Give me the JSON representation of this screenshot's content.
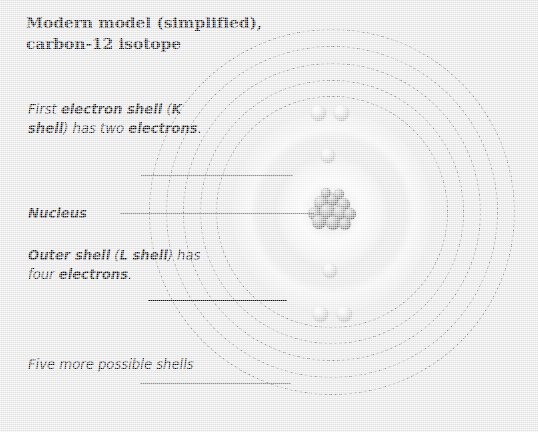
{
  "diagram": {
    "title_line1": "Modern model (simplified),",
    "title_line2": "carbon-12 isotope",
    "background_color": "#e9e9e9",
    "line_color": "#1a1a1a",
    "dashed_ring_color": "#8d8f91"
  },
  "callouts": {
    "k_shell": {
      "name": "first-electron-shell",
      "segments": [
        {
          "text": "First ",
          "bold": false
        },
        {
          "text": "electron shell",
          "bold": true
        },
        {
          "text": " (",
          "bold": false
        },
        {
          "text": "K shell",
          "bold": true
        },
        {
          "text": ") has two ",
          "bold": false
        },
        {
          "text": "electrons",
          "bold": true
        },
        {
          "text": ".",
          "bold": false
        }
      ]
    },
    "nucleus": {
      "name": "nucleus",
      "segments": [
        {
          "text": "Nucleus",
          "bold": true
        }
      ]
    },
    "l_shell": {
      "name": "outer-electron-shell",
      "segments": [
        {
          "text": "Outer shell",
          "bold": true
        },
        {
          "text": " (",
          "bold": false
        },
        {
          "text": "L shell",
          "bold": true
        },
        {
          "text": ") has four ",
          "bold": false
        },
        {
          "text": "electrons",
          "bold": true
        },
        {
          "text": ".",
          "bold": false
        }
      ]
    },
    "more_shells": {
      "name": "five-more-possible-shells",
      "segments": [
        {
          "text": "Five more possible shells",
          "bold": false
        }
      ]
    }
  },
  "atom": {
    "center_x": 332,
    "center_y": 212,
    "element": "carbon-12",
    "nucleon_count": 12,
    "proton_count": 6,
    "neutron_count": 6,
    "shells": [
      {
        "label": "K shell",
        "type": "solid",
        "radius": 58,
        "electrons": 2
      },
      {
        "label": "L shell",
        "type": "solid",
        "radius": 100,
        "electrons": 4
      },
      {
        "label": "possible shell 3",
        "type": "dashed",
        "radius": 116,
        "electrons": 0
      },
      {
        "label": "possible shell 4",
        "type": "dashed",
        "radius": 132,
        "electrons": 0
      },
      {
        "label": "possible shell 5",
        "type": "dashed",
        "radius": 149,
        "electrons": 0
      },
      {
        "label": "possible shell 6",
        "type": "dashed",
        "radius": 166,
        "electrons": 0
      },
      {
        "label": "possible shell 7",
        "type": "dashed",
        "radius": 183,
        "electrons": 0
      }
    ],
    "electrons": [
      {
        "shell": "K",
        "x": 328,
        "y": 155,
        "d": 14
      },
      {
        "shell": "K",
        "x": 330,
        "y": 270,
        "d": 14
      },
      {
        "shell": "L",
        "x": 318,
        "y": 112,
        "d": 15
      },
      {
        "shell": "L",
        "x": 341,
        "y": 112,
        "d": 15
      },
      {
        "shell": "L",
        "x": 320,
        "y": 313,
        "d": 15
      },
      {
        "shell": "L",
        "x": 344,
        "y": 313,
        "d": 15
      }
    ],
    "nucleons": [
      {
        "x": 332,
        "y": 199,
        "d": 13
      },
      {
        "x": 321,
        "y": 203,
        "d": 14
      },
      {
        "x": 343,
        "y": 204,
        "d": 13
      },
      {
        "x": 314,
        "y": 213,
        "d": 13
      },
      {
        "x": 327,
        "y": 211,
        "d": 15
      },
      {
        "x": 340,
        "y": 213,
        "d": 14
      },
      {
        "x": 350,
        "y": 214,
        "d": 12
      },
      {
        "x": 319,
        "y": 222,
        "d": 14
      },
      {
        "x": 333,
        "y": 223,
        "d": 14
      },
      {
        "x": 345,
        "y": 224,
        "d": 12
      },
      {
        "x": 326,
        "y": 193,
        "d": 10
      },
      {
        "x": 339,
        "y": 194,
        "d": 10
      }
    ]
  },
  "leader_lines": [
    {
      "name": "leader-k-shell",
      "x1": 141,
      "x2": 293,
      "y": 175
    },
    {
      "name": "leader-nucleus",
      "x1": 120,
      "x2": 314,
      "y": 213
    },
    {
      "name": "leader-outer-shell",
      "x1": 148,
      "x2": 287,
      "y": 300
    },
    {
      "name": "leader-more-shells",
      "x1": 140,
      "x2": 291,
      "y": 383
    }
  ]
}
